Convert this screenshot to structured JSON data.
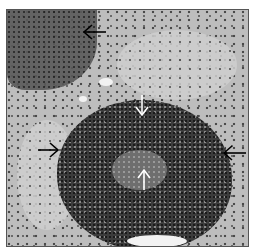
{
  "image": {
    "description": "Grayscale histology micrograph showing a dense cellular focus (granuloma/inflammatory infiltrate) within parenchyma, marked by arrows",
    "frame_color": "#555555",
    "arrows": [
      {
        "name": "top-left-arrow",
        "color": "#000000",
        "direction": "left",
        "x": 96,
        "y": 32
      },
      {
        "name": "left-arrow",
        "color": "#000000",
        "direction": "right",
        "x": 38,
        "y": 150
      },
      {
        "name": "right-arrow",
        "color": "#000000",
        "direction": "left",
        "x": 226,
        "y": 153
      },
      {
        "name": "center-top-arrow",
        "color": "#ffffff",
        "direction": "down",
        "x": 142,
        "y": 112
      },
      {
        "name": "center-bottom-arrow",
        "color": "#ffffff",
        "direction": "up",
        "x": 144,
        "y": 178
      }
    ]
  }
}
